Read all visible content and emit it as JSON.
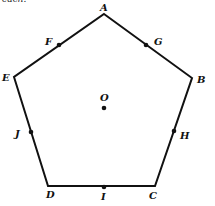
{
  "figure": {
    "type": "regular pentagon with center and edge midpoints",
    "top_fragment": "each.",
    "vertices": [
      {
        "label": "A",
        "x": 104,
        "y": 14
      },
      {
        "label": "B",
        "x": 192,
        "y": 78
      },
      {
        "label": "C",
        "x": 155,
        "y": 186
      },
      {
        "label": "D",
        "x": 48,
        "y": 186
      },
      {
        "label": "E",
        "x": 14,
        "y": 77
      }
    ],
    "midpoints": [
      {
        "label": "F",
        "x": 59,
        "y": 45
      },
      {
        "label": "G",
        "x": 146,
        "y": 45
      },
      {
        "label": "H",
        "x": 174,
        "y": 131
      },
      {
        "label": "I",
        "x": 104,
        "y": 187
      },
      {
        "label": "J",
        "x": 31,
        "y": 132
      }
    ],
    "center": {
      "label": "O",
      "x": 104,
      "y": 108
    },
    "labels": {
      "A": "A",
      "B": "B",
      "C": "C",
      "D": "D",
      "E": "E",
      "F": "F",
      "G": "G",
      "H": "H",
      "I": "I",
      "J": "J",
      "O": "O"
    }
  }
}
